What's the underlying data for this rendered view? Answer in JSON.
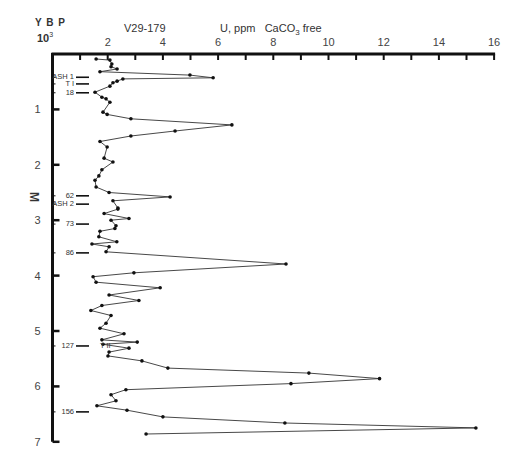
{
  "header": {
    "core": "V29-179",
    "quantity": "U, ppm",
    "basis": "CaCO",
    "basis_sub": "3",
    "basis_suffix": " free",
    "ybp": "Y B P",
    "ybp_unit": "10",
    "ybp_exp": "3"
  },
  "axis_y_label": "M",
  "chart_data": {
    "type": "line",
    "xlabel": "U, ppm CaCO3 free",
    "ylabel": "M",
    "x_axis_position": "top",
    "y_inverted": true,
    "xlim": [
      0,
      16
    ],
    "ylim": [
      0,
      7
    ],
    "x_ticks": [
      0,
      1,
      2,
      3,
      4,
      5,
      6,
      7,
      8,
      9,
      10,
      11,
      12,
      13,
      14,
      15,
      16
    ],
    "x_tick_labels": [
      "2",
      "4",
      "6",
      "8",
      "10",
      "12",
      "14",
      "16"
    ],
    "x_tick_label_values": [
      2,
      4,
      6,
      8,
      10,
      12,
      14,
      16
    ],
    "y_tick_labels": [
      "1",
      "2",
      "3",
      "4",
      "5",
      "6",
      "7"
    ],
    "grid": false,
    "series": [
      {
        "name": "U ppm (CaCO3 free)",
        "depth_m": [
          0.09,
          0.11,
          0.18,
          0.23,
          0.27,
          0.32,
          0.38,
          0.43,
          0.45,
          0.49,
          0.52,
          0.58,
          0.69,
          0.78,
          0.81,
          0.87,
          1.05,
          1.09,
          1.17,
          1.28,
          1.39,
          1.48,
          1.58,
          1.68,
          1.88,
          1.95,
          2.09,
          2.2,
          2.28,
          2.4,
          2.5,
          2.58,
          2.65,
          2.78,
          2.8,
          2.88,
          2.97,
          3.0,
          3.1,
          3.15,
          3.2,
          3.3,
          3.39,
          3.43,
          3.48,
          3.57,
          3.79,
          3.95,
          4.02,
          4.12,
          4.22,
          4.35,
          4.45,
          4.54,
          4.63,
          4.72,
          4.86,
          4.95,
          5.05,
          5.16,
          5.2,
          5.24,
          5.31,
          5.38,
          5.45,
          5.54,
          5.67,
          5.76,
          5.86,
          5.95,
          6.06,
          6.15,
          6.26,
          6.35,
          6.43,
          6.55,
          6.66,
          6.75,
          6.86
        ],
        "values": [
          1.58,
          2.08,
          2.15,
          2.12,
          2.34,
          1.72,
          4.98,
          5.82,
          2.55,
          2.34,
          2.19,
          2.08,
          1.54,
          1.79,
          1.94,
          2.08,
          1.83,
          1.98,
          2.84,
          6.5,
          4.44,
          2.84,
          1.72,
          1.98,
          1.87,
          2.19,
          1.79,
          1.68,
          1.54,
          1.58,
          2.05,
          4.26,
          2.19,
          2.37,
          2.37,
          1.87,
          2.77,
          2.12,
          2.3,
          2.26,
          1.72,
          1.68,
          2.33,
          1.43,
          2.05,
          1.94,
          8.46,
          2.95,
          1.47,
          1.58,
          3.9,
          2.05,
          3.13,
          1.79,
          1.39,
          2.12,
          1.94,
          1.72,
          2.59,
          1.79,
          3.07,
          1.83,
          2.77,
          2.05,
          2.01,
          3.24,
          4.18,
          9.29,
          11.85,
          8.64,
          2.66,
          2.12,
          2.3,
          1.61,
          2.7,
          4.0,
          8.42,
          15.34,
          3.39
        ]
      }
    ],
    "annotations": [
      {
        "label": "ASH 1",
        "depth_m": 0.42
      },
      {
        "label": "T I",
        "depth_m": 0.54
      },
      {
        "label": "18",
        "depth_m": 0.7
      },
      {
        "label": "62",
        "depth_m": 2.56
      },
      {
        "label": "ASH 2",
        "depth_m": 2.71
      },
      {
        "label": "73",
        "depth_m": 3.07
      },
      {
        "label": "86",
        "depth_m": 3.59
      },
      {
        "label": "127",
        "depth_m": 5.27
      },
      {
        "label": "T II",
        "depth_m": 5.27
      },
      {
        "label": "156",
        "depth_m": 6.46
      }
    ]
  }
}
